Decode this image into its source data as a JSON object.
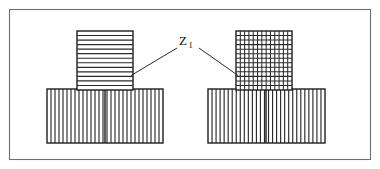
{
  "figure": {
    "title": "",
    "background_color": "#ffffff",
    "frame": {
      "name": "outer-border",
      "x": 9,
      "y": 9,
      "width": 362,
      "height": 151,
      "stroke_color": "#6f6f73"
    },
    "callout": {
      "label": "Z",
      "subscript": "1",
      "full_label": "Z1",
      "x": 183,
      "y": 44,
      "color": "#101012"
    },
    "leaders": [
      {
        "name": "leader-left",
        "from_x": 178,
        "from_y": 48,
        "via_x": 178,
        "via_y": 48,
        "to_x": 131,
        "to_y": 75
      },
      {
        "name": "leader-right",
        "from_x": 199,
        "from_y": 48,
        "to_x": 238,
        "to_y": 75
      }
    ],
    "assemblies": [
      {
        "name": "left-assembly",
        "upper_block": {
          "name": "horizontal-hatched-block",
          "hatch_type": "horizontal",
          "hatch_count": 13,
          "x": 77,
          "y": 31,
          "width": 56,
          "height": 59,
          "fill": "#ffffff",
          "stroke": "#1d1d1f"
        },
        "base_block": {
          "name": "vertical-hatched-base",
          "hatch_type": "vertical",
          "hatch_count": 29,
          "x": 47,
          "y": 89,
          "width": 116,
          "height": 54,
          "fill": "#ffffff",
          "stroke": "#1d1d1f",
          "has_center_divider": true,
          "divider_x": 105
        }
      },
      {
        "name": "right-assembly",
        "upper_block": {
          "name": "cross-hatched-block",
          "hatch_type": "cross",
          "hatch_count_vertical": 13,
          "hatch_count_horizontal": 13,
          "x": 236,
          "y": 31,
          "width": 56,
          "height": 59,
          "fill": "#ffffff",
          "stroke": "#1d1d1f"
        },
        "base_block": {
          "name": "vertical-hatched-base",
          "hatch_type": "vertical",
          "hatch_count": 29,
          "x": 208,
          "y": 89,
          "width": 117,
          "height": 54,
          "fill": "#ffffff",
          "stroke": "#1d1d1f",
          "has_center_divider": true,
          "divider_x": 266
        }
      }
    ]
  }
}
